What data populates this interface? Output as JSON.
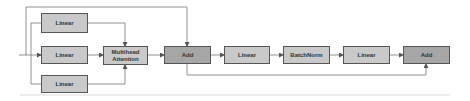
{
  "diagram": {
    "type": "flowchart",
    "nodes": [
      {
        "id": "linear_q",
        "label": "Linear",
        "style": "light"
      },
      {
        "id": "linear_k",
        "label": "Linear",
        "style": "light"
      },
      {
        "id": "linear_v",
        "label": "Linear",
        "style": "light"
      },
      {
        "id": "mha",
        "label": "Multihead Attention",
        "label_line1": "Multihead",
        "label_line2": "Attention",
        "style": "light"
      },
      {
        "id": "add1",
        "label": "Add",
        "style": "dark"
      },
      {
        "id": "linear_ff1",
        "label": "Linear",
        "style": "light"
      },
      {
        "id": "batchnorm",
        "label": "BatchNorm",
        "style": "light"
      },
      {
        "id": "linear_ff2",
        "label": "Linear",
        "style": "light"
      },
      {
        "id": "add2",
        "label": "Add",
        "style": "dark"
      }
    ],
    "edges": [
      {
        "from": "input",
        "to": "linear_q"
      },
      {
        "from": "input",
        "to": "linear_k"
      },
      {
        "from": "input",
        "to": "linear_v"
      },
      {
        "from": "input",
        "to": "add1",
        "note": "residual skip (top)"
      },
      {
        "from": "linear_q",
        "to": "mha"
      },
      {
        "from": "linear_k",
        "to": "mha"
      },
      {
        "from": "linear_v",
        "to": "mha"
      },
      {
        "from": "mha",
        "to": "add1"
      },
      {
        "from": "add1",
        "to": "linear_ff1"
      },
      {
        "from": "linear_ff1",
        "to": "batchnorm"
      },
      {
        "from": "batchnorm",
        "to": "linear_ff2"
      },
      {
        "from": "linear_ff2",
        "to": "add2"
      },
      {
        "from": "add1",
        "to": "add2",
        "note": "residual skip (bottom)"
      }
    ],
    "colors": {
      "light_fill": "#c9c9c9",
      "dark_fill": "#a6a6a6",
      "border": "#555555",
      "wire": "#666666",
      "divider": "#d0d0d0"
    }
  }
}
